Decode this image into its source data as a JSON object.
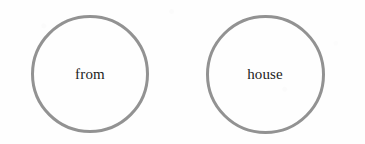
{
  "page": {
    "kind": "word-circle-worksheet",
    "background_color": "#fefefe",
    "width": 365,
    "height": 144
  },
  "style": {
    "circle_stroke_color": "#929292",
    "circle_stroke_width_px": 3,
    "label_color": "#1c1c1c",
    "label_font_size_px": 15
  },
  "circles": [
    {
      "id": "circle-from",
      "word": "from",
      "center_x": 90,
      "center_y": 74,
      "diameter": 118
    },
    {
      "id": "circle-house",
      "word": "house",
      "center_x": 265,
      "center_y": 74,
      "diameter": 119
    }
  ]
}
